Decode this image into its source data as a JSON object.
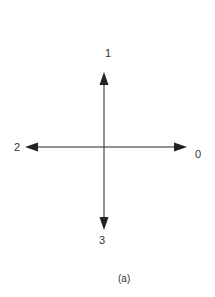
{
  "diagram": {
    "type": "direction-arrows",
    "center": {
      "x": 104,
      "y": 147
    },
    "colors": {
      "line": "#222222",
      "text": "#333333",
      "background": "#ffffff"
    },
    "arrows": [
      {
        "direction": "right",
        "label": "0"
      },
      {
        "direction": "up",
        "label": "1"
      },
      {
        "direction": "left",
        "label": "2"
      },
      {
        "direction": "down",
        "label": "3"
      }
    ],
    "caption": "(a)"
  }
}
